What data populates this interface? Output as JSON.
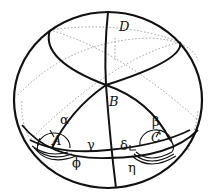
{
  "diagram": {
    "title": "",
    "type": "spherical geometry figure",
    "points": [
      {
        "id": "A",
        "label": "A"
      },
      {
        "id": "B",
        "label": "B"
      },
      {
        "id": "C",
        "label": "C"
      },
      {
        "id": "D",
        "label": "D"
      }
    ],
    "angles": [
      {
        "id": "alpha",
        "label": "α"
      },
      {
        "id": "beta",
        "label": "β"
      },
      {
        "id": "gamma",
        "label": "γ"
      },
      {
        "id": "delta",
        "label": "δ"
      },
      {
        "id": "phi",
        "label": "ϕ"
      },
      {
        "id": "eta",
        "label": "η"
      }
    ],
    "colors": {
      "stroke": "#111111",
      "dotted": "#888888",
      "background": "#ffffff"
    }
  }
}
